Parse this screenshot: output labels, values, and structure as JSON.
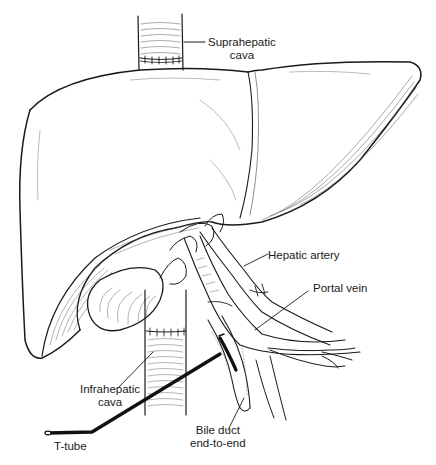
{
  "figure": {
    "colors": {
      "ink": "#1a1a1a",
      "background": "#ffffff",
      "tube": "#111111"
    }
  },
  "labels": {
    "suprahepatic_cava": {
      "line1": "Suprahepatic",
      "line2": "cava"
    },
    "hepatic_artery": "Hepatic artery",
    "portal_vein": "Portal vein",
    "infrahepatic_cava": {
      "line1": "Infrahepatic",
      "line2": "cava"
    },
    "bile_duct": {
      "line1": "Bile duct",
      "line2": "end-to-end"
    },
    "t_tube": "T-tube"
  }
}
